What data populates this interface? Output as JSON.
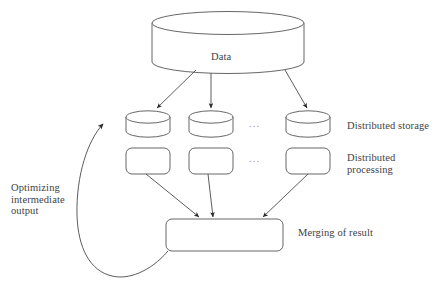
{
  "diagram": {
    "title_text": "Data",
    "source": {
      "name": "data-cylinder",
      "label": "Data"
    },
    "storage_row": {
      "label": "Distributed storage",
      "ellipsis": "...",
      "nodes": [
        {
          "label": ""
        },
        {
          "label": ""
        },
        {
          "label": ""
        }
      ]
    },
    "processing_row": {
      "label": "Distributed\nprocessing",
      "label_line1": "Distributed",
      "label_line2": "processing",
      "ellipsis": "...",
      "nodes": [
        {
          "label": ""
        },
        {
          "label": ""
        },
        {
          "label": ""
        }
      ]
    },
    "merge": {
      "label": "Merging of result",
      "box_label": ""
    },
    "feedback": {
      "label_line1": "Optimizing",
      "label_line2": "intermediate",
      "label_line3": "output",
      "label": "Optimizing intermediate output"
    },
    "colors": {
      "stroke": "#555555",
      "connector": "#4a4a4a",
      "text": "#3f3f3f",
      "background": "#ffffff",
      "ellipsis": "#9a9a9a"
    }
  }
}
